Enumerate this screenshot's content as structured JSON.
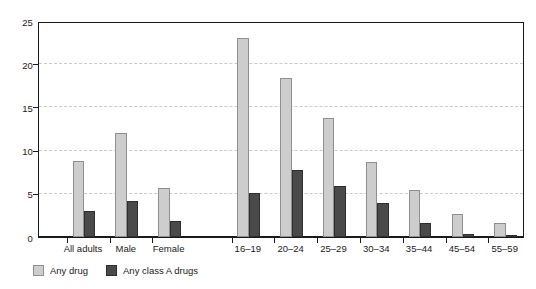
{
  "chart_data": {
    "type": "bar",
    "title": "",
    "subtitle": "",
    "xlabel": "",
    "ylabel": "",
    "ylim": [
      0,
      25
    ],
    "ytick_labels": [
      "0",
      "5",
      "10",
      "15",
      "20",
      "25"
    ],
    "ytick_values": [
      0,
      5,
      10,
      15,
      20,
      25
    ],
    "grid": "horizontal-dashed",
    "legend_position": "bottom-left",
    "categories": [
      "All adults",
      "Male",
      "Female",
      "16–19",
      "20–24",
      "25–29",
      "30–34",
      "35–44",
      "45–54",
      "55–59"
    ],
    "series": [
      {
        "name": "Any drug",
        "color": "#cdcdcd",
        "values": [
          8.8,
          12.0,
          5.7,
          23.0,
          18.4,
          13.8,
          8.7,
          5.4,
          2.7,
          1.6
        ]
      },
      {
        "name": "Any class A drugs",
        "color": "#4a4a4a",
        "values": [
          3.0,
          4.2,
          1.8,
          5.1,
          7.7,
          5.9,
          3.9,
          1.6,
          0.4,
          0.15
        ]
      }
    ],
    "group_gap_after_index": 2
  },
  "legend": {
    "items": [
      {
        "label": "Any drug",
        "swatch": "light"
      },
      {
        "label": "Any class A drugs",
        "swatch": "dark"
      }
    ]
  },
  "axis_colors": {
    "axis_line": "#1a1a1a",
    "gridline": "#c9c9c9",
    "text": "#1a1a1a",
    "background": "#ffffff"
  }
}
